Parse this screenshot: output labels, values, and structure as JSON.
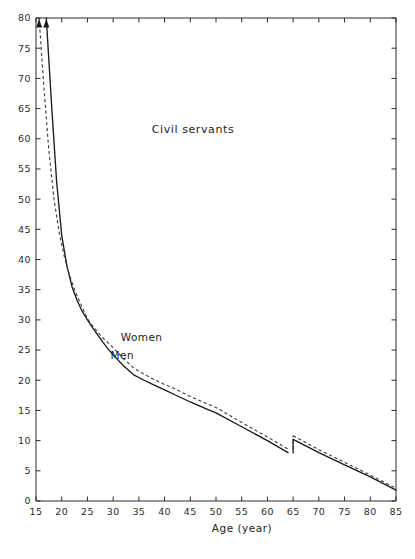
{
  "chart_data": {
    "type": "line",
    "title": "Civil servants",
    "subtitle": "",
    "xlabel": "Age (year)",
    "ylabel": "",
    "xlim": [
      15,
      85
    ],
    "ylim": [
      0,
      80
    ],
    "xticks": [
      15,
      20,
      25,
      30,
      35,
      40,
      45,
      50,
      55,
      60,
      65,
      70,
      75,
      80,
      85
    ],
    "yticks": [
      0,
      5,
      10,
      15,
      20,
      25,
      30,
      35,
      40,
      45,
      50,
      55,
      60,
      65,
      70,
      75,
      80
    ],
    "xtick_labels": [
      "15",
      "20",
      "25",
      "30",
      "35",
      "40",
      "45",
      "50",
      "55",
      "60",
      "65",
      "70",
      "75",
      "80",
      "85"
    ],
    "ytick_labels": [
      "0",
      "5",
      "10",
      "15",
      "20",
      "25",
      "30",
      "35",
      "40",
      "45",
      "50",
      "55",
      "60",
      "65",
      "70",
      "75",
      "80"
    ],
    "grid": false,
    "legend_position": "inline-annotation",
    "series": [
      {
        "name": "Men",
        "style": "solid",
        "color": "#1a1a1a",
        "label_position": {
          "x": 29.5,
          "y": 23.5
        },
        "arrow_at_top": true,
        "arrow_x": 17.0,
        "x": [
          17.0,
          18.0,
          19.0,
          20.0,
          21.0,
          22.0,
          23.0,
          24.0,
          25.0,
          26.0,
          27.0,
          28.0,
          29.0,
          30.0,
          32.0,
          34.0,
          36.0,
          38.0,
          40.0,
          42.0,
          45.0,
          48.0,
          50.0,
          55.0,
          60.0,
          64.0,
          65.0,
          70.0,
          75.0,
          80.0,
          85.0
        ],
        "y": [
          80.0,
          66.0,
          53.0,
          44.0,
          39.0,
          35.5,
          33.2,
          31.4,
          30.0,
          28.7,
          27.5,
          26.3,
          25.2,
          24.2,
          22.4,
          20.9,
          20.0,
          19.2,
          18.4,
          17.6,
          16.4,
          15.3,
          14.6,
          12.3,
          10.0,
          8.0,
          10.2,
          8.0,
          6.0,
          4.0,
          1.8
        ]
      },
      {
        "name": "Women",
        "style": "dashed",
        "color": "#3a3a3a",
        "label_position": {
          "x": 31.5,
          "y": 26.5
        },
        "arrow_at_top": true,
        "arrow_x": 15.6,
        "x": [
          15.6,
          16.5,
          17.5,
          18.5,
          19.5,
          20.5,
          21.5,
          22.5,
          23.5,
          25.0,
          26.0,
          27.0,
          28.0,
          29.0,
          30.0,
          32.0,
          34.0,
          36.0,
          38.0,
          40.0,
          42.0,
          45.0,
          48.0,
          50.0,
          55.0,
          60.0,
          64.0,
          65.0,
          70.0,
          75.0,
          80.0,
          85.0
        ],
        "y": [
          80.0,
          69.0,
          58.0,
          50.0,
          44.5,
          40.5,
          37.4,
          35.0,
          33.0,
          30.2,
          29.0,
          28.0,
          27.0,
          26.2,
          25.4,
          23.6,
          22.0,
          21.0,
          20.1,
          19.3,
          18.6,
          17.3,
          16.2,
          15.5,
          13.0,
          10.6,
          8.6,
          10.8,
          8.5,
          6.4,
          4.3,
          2.1
        ]
      }
    ]
  },
  "axes": {
    "title_position": {
      "x": 37.5,
      "y": 61.0
    },
    "x_axis_title": "Age (year)"
  }
}
